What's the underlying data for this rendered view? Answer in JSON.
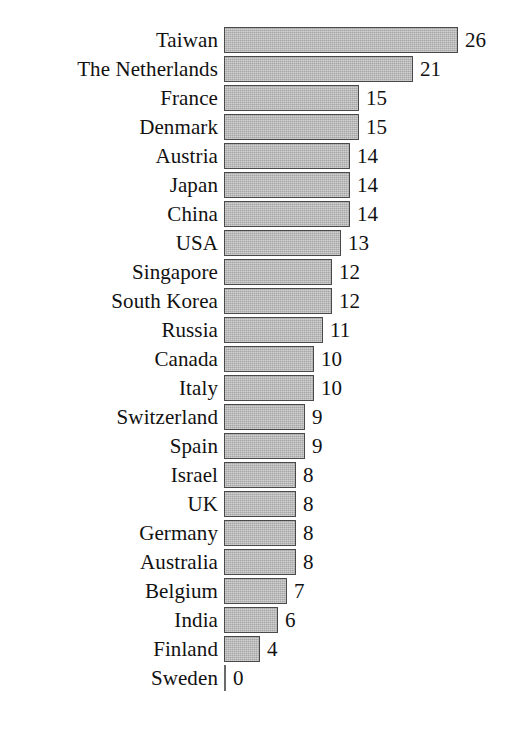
{
  "chart_data": {
    "type": "bar",
    "orientation": "horizontal",
    "title": "",
    "subtitle": "",
    "xlabel": "",
    "ylabel": "",
    "grid": false,
    "legend": null,
    "axis_tick_labels": [],
    "xlim": [
      0,
      26
    ],
    "categories": [
      "Taiwan",
      "The Netherlands",
      "France",
      "Denmark",
      "Austria",
      "Japan",
      "China",
      "USA",
      "Singapore",
      "South Korea",
      "Russia",
      "Canada",
      "Italy",
      "Switzerland",
      "Spain",
      "Israel",
      "UK",
      "Germany",
      "Australia",
      "Belgium",
      "India",
      "Finland",
      "Sweden"
    ],
    "values": [
      26,
      21,
      15,
      15,
      14,
      14,
      14,
      13,
      12,
      12,
      11,
      10,
      10,
      9,
      9,
      8,
      8,
      8,
      8,
      7,
      6,
      4,
      0
    ],
    "value_labels": [
      "26",
      "21",
      "15",
      "15",
      "14",
      "14",
      "14",
      "13",
      "12",
      "12",
      "11",
      "10",
      "10",
      "9",
      "9",
      "8",
      "8",
      "8",
      "8",
      "7",
      "6",
      "4",
      "0"
    ],
    "bar_fill_color": "#b6b6b6",
    "bar_border_color": "#4a4a4a",
    "background_color": "#ffffff",
    "text_color": "#111111"
  }
}
